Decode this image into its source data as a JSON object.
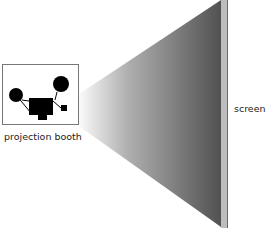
{
  "diagram": {
    "labels": {
      "booth": "projection booth",
      "screen": "screen"
    },
    "colors": {
      "beam_dark": "#555555",
      "beam_light": "#ffffff",
      "screen_face": "#b8b8b8",
      "screen_edge": "#6a6a6a",
      "projector": "#000000",
      "booth_border": "#777777"
    }
  }
}
